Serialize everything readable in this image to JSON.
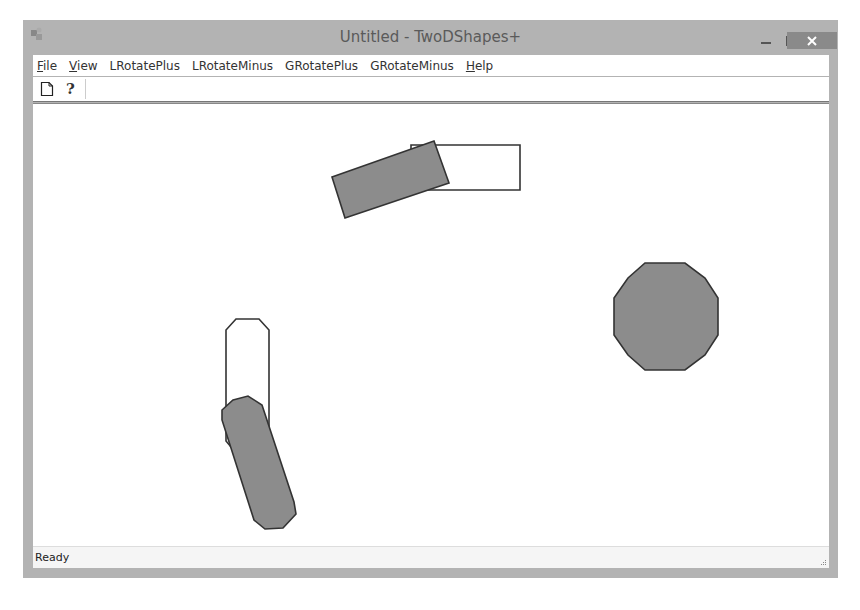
{
  "window": {
    "title": "Untitled - TwoDShapes+",
    "controls": {
      "minimize": "–",
      "maximize": "☐",
      "close": "✕"
    }
  },
  "menubar": {
    "items": [
      {
        "label": "File",
        "underline": "F"
      },
      {
        "label": "View",
        "underline": "V"
      },
      {
        "label": "LRotatePlus"
      },
      {
        "label": "LRotateMinus"
      },
      {
        "label": "GRotatePlus"
      },
      {
        "label": "GRotateMinus"
      },
      {
        "label": "Help",
        "underline": "H"
      }
    ]
  },
  "toolbar": {
    "buttons": [
      {
        "icon": "new-document-icon",
        "tooltip": "New"
      },
      {
        "icon": "help-icon",
        "tooltip": "About"
      }
    ]
  },
  "canvas": {
    "fill_color": "#8c8c8c",
    "stroke_color": "#333333",
    "shapes": [
      {
        "name": "rectangle-outline",
        "type": "polygon",
        "filled": false,
        "points": "411,145 520,145 520,190 411,190"
      },
      {
        "name": "rectangle-rotated-filled",
        "type": "polygon",
        "filled": true,
        "points": "332,177 434,141 449,183 345,218"
      },
      {
        "name": "dodecagon-filled",
        "type": "polygon",
        "filled": true,
        "points": "645,263 685,263 705,278 718,298 718,335 705,355 685,370 645,370 628,355 614,335 614,298 628,278"
      },
      {
        "name": "capsule-outline",
        "type": "polygon",
        "filled": false,
        "points": "236,319 259,319 269,330 269,441 259,453 236,453 226,441 226,330"
      },
      {
        "name": "capsule-rotated-filled",
        "type": "polygon",
        "filled": true,
        "points": "233,400 248,396 262,405 294,502 296,514 283,528 265,529 254,520 222,420 222,410"
      }
    ]
  },
  "statusbar": {
    "text": "Ready"
  }
}
